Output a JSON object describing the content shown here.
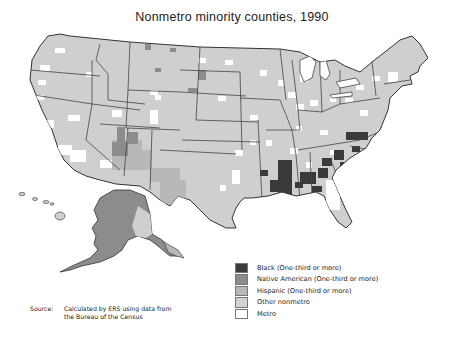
{
  "title": "Nonmetro minority counties, 1990",
  "map": {
    "type": "choropleth",
    "region": "United States (county level, incl. Alaska and Hawaii)",
    "year": "1990",
    "colors": {
      "black": "#3a3a3a",
      "native_american": "#8c8c8c",
      "hispanic": "#b8b8b8",
      "other_nonmetro": "#cfcfcf",
      "metro": "#ffffff",
      "state_border": "#333333"
    },
    "highlighted_areas": [
      {
        "category": "Black (One-third or more)",
        "regions": [
          "Mississippi Delta",
          "Alabama Black Belt",
          "Georgia",
          "South Carolina",
          "eastern North Carolina",
          "southern Virginia",
          "Louisiana"
        ]
      },
      {
        "category": "Native American (One-third or more)",
        "regions": [
          "Alaska",
          "Arizona/New Mexico (Navajo)",
          "South Dakota",
          "Montana",
          "North Dakota",
          "Oklahoma"
        ]
      },
      {
        "category": "Hispanic (One-third or more)",
        "regions": [
          "South Texas",
          "New Mexico",
          "southern Colorado",
          "southern Alaska panhandle area"
        ]
      }
    ]
  },
  "legend": {
    "items": [
      {
        "label": "Black (One-third or more)",
        "color": "#3a3a3a"
      },
      {
        "label": "Native American (One-third or more)",
        "color": "#8c8c8c"
      },
      {
        "label": "Hispanic (One-third or more)",
        "color": "#b8b8b8"
      },
      {
        "label": "Other nonmetro",
        "color": "#d2d2d2"
      },
      {
        "label": "Metro",
        "color": "#ffffff"
      }
    ]
  },
  "source": {
    "label": "Source:",
    "line1": "Calculated by ERS using data from",
    "line2": "the Bureau of the Census"
  }
}
